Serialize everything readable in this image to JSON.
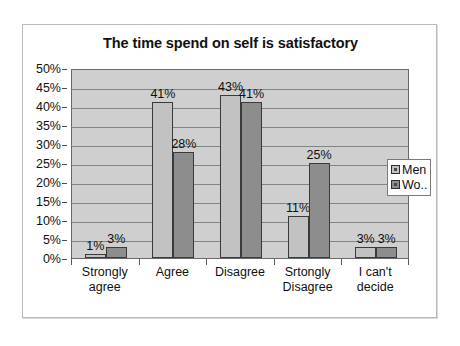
{
  "chart_data": {
    "type": "bar",
    "title": "The time spend on self is satisfactory",
    "xlabel": "",
    "ylabel": "",
    "ylim": [
      0,
      50
    ],
    "y_tick_labels": [
      "50%",
      "45%",
      "40%",
      "35%",
      "30%",
      "25%",
      "20%",
      "15%",
      "10%",
      "5%",
      "0%"
    ],
    "y_tick_values": [
      50,
      45,
      40,
      35,
      30,
      25,
      20,
      15,
      10,
      5,
      0
    ],
    "grid": true,
    "legend_position": "right-inside",
    "categories": [
      "Strongly agree",
      "Agree",
      "Disagree",
      "Srtongly Disagree",
      "I can't decide"
    ],
    "category_label_lines": [
      [
        "Strongly",
        "agree"
      ],
      [
        "Agree"
      ],
      [
        "Disagree"
      ],
      [
        "Srtongly",
        "Disagree"
      ],
      [
        "I can't",
        "decide"
      ]
    ],
    "series": [
      {
        "name": "Men",
        "color": "#c2c2c2",
        "values": [
          1,
          41,
          43,
          11,
          3
        ],
        "labels": [
          "1%",
          "41%",
          "43%",
          "11%",
          "3%"
        ]
      },
      {
        "name": "Wo..",
        "color": "#8d8d8d",
        "values": [
          3,
          28,
          41,
          25,
          3
        ],
        "labels": [
          "3%",
          "28%",
          "41%",
          "25%",
          "3%"
        ]
      }
    ]
  },
  "legend": {
    "entries": [
      {
        "label": "Men",
        "swatch": "men"
      },
      {
        "label": "Wo..",
        "swatch": "women"
      }
    ]
  },
  "colors": {
    "plot_background": "#cfcfcf",
    "men_bar": "#c2c2c2",
    "women_bar": "#8d8d8d",
    "gridline": "#848484",
    "axis": "#6a6a6a",
    "text": "#111111"
  }
}
